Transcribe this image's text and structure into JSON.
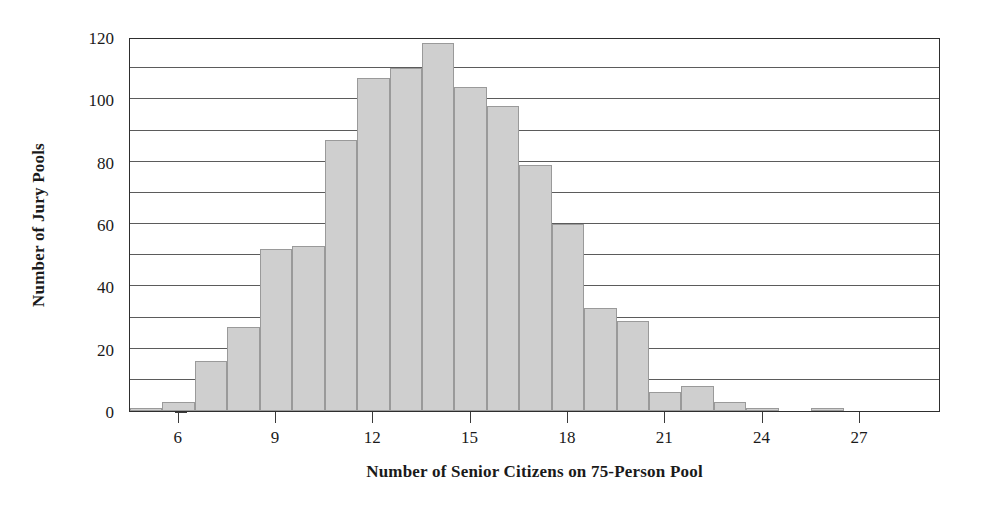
{
  "chart_data": {
    "type": "bar",
    "title": "",
    "subtitle": "",
    "xlabel": "Number of Senior Citizens on 75-Person Pool",
    "ylabel": "Number of Jury Pools",
    "xlim": [
      4.5,
      29.5
    ],
    "ylim": [
      0,
      120
    ],
    "grid": "horizontal",
    "legend": "none",
    "bar_fill_color": "#cfcfcf",
    "bar_border_color": "#9a9a9a",
    "axis_color": "#2e2e2e",
    "gridline_color": "#5b5b5b",
    "x_ticks": [
      6,
      9,
      12,
      15,
      18,
      21,
      24,
      27
    ],
    "x_tick_labels": [
      "6",
      "9",
      "12",
      "15",
      "18",
      "21",
      "24",
      "27"
    ],
    "y_ticks": [
      0,
      20,
      40,
      60,
      80,
      100,
      120
    ],
    "y_tick_labels": [
      "0",
      "20",
      "40",
      "60",
      "80",
      "100",
      "120"
    ],
    "y_gridlines": [
      10,
      20,
      30,
      40,
      50,
      60,
      70,
      80,
      90,
      100,
      110,
      120
    ],
    "bin_width": 1,
    "categories": [
      5,
      6,
      7,
      8,
      9,
      10,
      11,
      12,
      13,
      14,
      15,
      16,
      17,
      18,
      19,
      20,
      21,
      22,
      23,
      24,
      25,
      26,
      27
    ],
    "values": [
      1,
      3,
      16,
      27,
      52,
      53,
      87,
      107,
      110,
      118,
      104,
      98,
      79,
      60,
      33,
      29,
      6,
      8,
      3,
      1,
      0,
      1,
      0
    ]
  }
}
